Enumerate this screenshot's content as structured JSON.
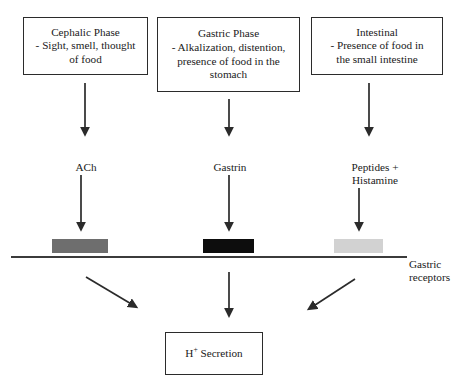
{
  "diagram": {
    "title_boxes": [
      {
        "id": "cephalic",
        "text": "Cephalic Phase\n- Sight, smell, thought\nof food"
      },
      {
        "id": "gastric",
        "text": "Gastric Phase\n- Alkalization, distention,\npresence of food in the\nstomach"
      },
      {
        "id": "intestinal",
        "text": "Intestinal\n- Presence of food in\nthe small intestine"
      }
    ],
    "mediators": [
      {
        "id": "ach",
        "text": "ACh"
      },
      {
        "id": "gastrin",
        "text": "Gastrin"
      },
      {
        "id": "peptides-histamine",
        "text": "Peptides +\nHistamine"
      }
    ],
    "receptors": {
      "label": "Gastric\nreceptors",
      "bars": [
        {
          "id": "ach-receptor",
          "color": "#6e6e6e"
        },
        {
          "id": "gastrin-receptor",
          "color": "#0d0d0d"
        },
        {
          "id": "histamine-receptor",
          "color": "#d2d2d2"
        }
      ],
      "membrane_color": "#3b3b3b"
    },
    "output_box": {
      "id": "h-secretion",
      "text_prefix": "H",
      "text_superscript": "+",
      "text_suffix": " Secretion"
    },
    "arrow_color": "#2b2b2b"
  }
}
